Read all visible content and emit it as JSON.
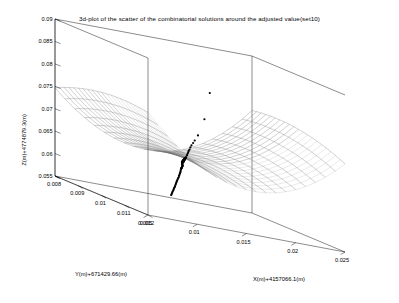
{
  "figure": {
    "title": "3d-plot of the scatter of the combinatorial solutions around the adjusted value(set10)",
    "background": "#ffffff",
    "axis_color": "#000000",
    "mesh_color": "#6f6f6f",
    "point_color": "#000000"
  },
  "chart_data": {
    "type": "scatter",
    "title": "3d-plot of the scatter of the combinatorial solutions around the adjusted value(set10)",
    "projection": "3d",
    "xlabel": "X(m)+4157066.1(m)",
    "ylabel": "Y(m)+671429.66(m)",
    "zlabel": "Z(m)+4774879.3(m)",
    "xticks": [
      0.005,
      0.01,
      0.015,
      0.02,
      0.025
    ],
    "xticklabels": [
      "0.005",
      "0.01",
      "0.015",
      "0.02",
      "0.025"
    ],
    "yticks": [
      0.012,
      0.011,
      0.01,
      0.009,
      0.008
    ],
    "yticklabels": [
      "0.012",
      "0.011",
      "0.01",
      "0.009",
      "0.008"
    ],
    "zticks": [
      0.055,
      0.06,
      0.065,
      0.07,
      0.075,
      0.08,
      0.085,
      0.09
    ],
    "zticklabels": [
      "0.055",
      "0.06",
      "0.065",
      "0.07",
      "0.075",
      "0.08",
      "0.085",
      "0.09"
    ],
    "xlim": [
      0.005,
      0.025
    ],
    "ylim": [
      0.008,
      0.012
    ],
    "zlim": [
      0.055,
      0.09
    ],
    "grid": false,
    "legend": null,
    "surface": {
      "kind": "mesh",
      "description": "saddle-shaped wireframe surface spanning the x-y domain",
      "nx": 21,
      "ny": 21,
      "z_center": 0.0665,
      "amp_x": 0.0115,
      "amp_y": 0.0035,
      "tilt": 0.0016
    },
    "points": [
      [
        0.0129,
        0.01012,
        0.0655
      ],
      [
        0.01325,
        0.01005,
        0.06605
      ],
      [
        0.01268,
        0.01022,
        0.06512
      ],
      [
        0.0135,
        0.00998,
        0.0664
      ],
      [
        0.01302,
        0.01008,
        0.06568
      ],
      [
        0.0124,
        0.0103,
        0.0648
      ],
      [
        0.01378,
        0.0099,
        0.06672
      ],
      [
        0.01312,
        0.01002,
        0.06588
      ],
      [
        0.01282,
        0.01018,
        0.0653
      ],
      [
        0.0134,
        0.00995,
        0.06625
      ],
      [
        0.01258,
        0.01025,
        0.06498
      ],
      [
        0.0136,
        0.00992,
        0.06652
      ],
      [
        0.01296,
        0.0101,
        0.06558
      ],
      [
        0.01228,
        0.01034,
        0.06465
      ],
      [
        0.0139,
        0.00986,
        0.0669
      ],
      [
        0.01318,
        0.01,
        0.06596
      ],
      [
        0.01274,
        0.0102,
        0.0652
      ],
      [
        0.01346,
        0.00994,
        0.06632
      ],
      [
        0.01252,
        0.01027,
        0.0649
      ],
      [
        0.01368,
        0.00989,
        0.06662
      ],
      [
        0.01306,
        0.01006,
        0.06575
      ],
      [
        0.01234,
        0.01032,
        0.06472
      ],
      [
        0.01356,
        0.00993,
        0.06645
      ],
      [
        0.01288,
        0.01014,
        0.06545
      ],
      [
        0.0133,
        0.01001,
        0.06612
      ],
      [
        0.01264,
        0.01023,
        0.06505
      ],
      [
        0.01384,
        0.00988,
        0.0668
      ],
      [
        0.013,
        0.01009,
        0.06562
      ],
      [
        0.01246,
        0.01028,
        0.06484
      ],
      [
        0.01372,
        0.00991,
        0.06668
      ],
      [
        0.01322,
        0.01003,
        0.066
      ],
      [
        0.01278,
        0.01019,
        0.06525
      ],
      [
        0.01352,
        0.00996,
        0.06638
      ],
      [
        0.0121,
        0.0104,
        0.0644
      ],
      [
        0.01196,
        0.01045,
        0.0642
      ],
      [
        0.01182,
        0.0105,
        0.06402
      ],
      [
        0.01168,
        0.01054,
        0.06385
      ],
      [
        0.0142,
        0.00978,
        0.0673
      ],
      [
        0.0144,
        0.00972,
        0.06758
      ],
      [
        0.0115,
        0.0106,
        0.0636
      ],
      [
        0.0146,
        0.00966,
        0.06785
      ],
      [
        0.01136,
        0.01064,
        0.06342
      ],
      [
        0.0148,
        0.0096,
        0.06812
      ],
      [
        0.0112,
        0.0107,
        0.0632
      ],
      [
        0.015,
        0.00955,
        0.0684
      ],
      [
        0.01104,
        0.01074,
        0.063
      ],
      [
        0.0153,
        0.00946,
        0.0688
      ],
      [
        0.01088,
        0.01079,
        0.0628
      ],
      [
        0.0107,
        0.01084,
        0.06258
      ],
      [
        0.0156,
        0.00938,
        0.0692
      ],
      [
        0.01054,
        0.01089,
        0.06236
      ],
      [
        0.01038,
        0.01094,
        0.06215
      ],
      [
        0.01022,
        0.01099,
        0.06194
      ],
      [
        0.01006,
        0.01104,
        0.06172
      ],
      [
        0.0099,
        0.01109,
        0.0615
      ],
      [
        0.00974,
        0.01114,
        0.06128
      ],
      [
        0.00958,
        0.01118,
        0.06108
      ],
      [
        0.00942,
        0.01123,
        0.06086
      ],
      [
        0.016,
        0.00928,
        0.06968
      ],
      [
        0.00926,
        0.01128,
        0.06064
      ],
      [
        0.0091,
        0.01132,
        0.06044
      ],
      [
        0.0164,
        0.00918,
        0.07018
      ],
      [
        0.00894,
        0.01137,
        0.06022
      ],
      [
        0.00878,
        0.01142,
        0.06
      ],
      [
        0.0172,
        0.00898,
        0.0712
      ],
      [
        0.0086,
        0.01147,
        0.05978
      ],
      [
        0.0201,
        0.00826,
        0.0803
      ],
      [
        0.0188,
        0.00858,
        0.0746
      ]
    ],
    "point_count": 69,
    "marker": "dot",
    "marker_size": 1.5
  },
  "view": {
    "azimuth_hint": "default matlab 3d view",
    "elevation_hint": "default matlab 3d view"
  }
}
